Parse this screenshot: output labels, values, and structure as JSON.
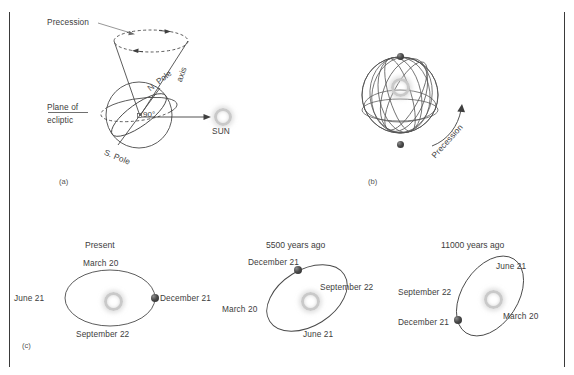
{
  "figure": {
    "background": "#ffffff",
    "line_color": "#4a4a4a",
    "text_color": "#3d3d3d",
    "sun_color": "#c9c9c9",
    "earth_color": "#3a3a3a"
  },
  "panels": [
    {
      "tag": "(a)",
      "labels": {
        "precession": "Precession",
        "n_pole": "N. Pole",
        "axis": "axis",
        "plane_of": "Plane of",
        "ecliptic": "ecliptic",
        "angle": "90",
        "angle_unit": "°",
        "s_pole": "S. Pole",
        "sun": "SUN"
      }
    },
    {
      "tag": "(b)",
      "labels": {
        "precession": "Precession"
      }
    },
    {
      "tag": "(c)",
      "orbits": [
        {
          "title": "Present",
          "top": "March 20",
          "left": "June 21",
          "right": "December 21",
          "bottom": "September 22"
        },
        {
          "title": "5500 years ago",
          "top": "December 21",
          "left": "March 20",
          "right": "September 22",
          "bottom": "June 21"
        },
        {
          "title": "11000 years ago",
          "top": "June 21",
          "left": "September 22",
          "right": "March 20",
          "bottom": "December 21"
        }
      ]
    }
  ]
}
